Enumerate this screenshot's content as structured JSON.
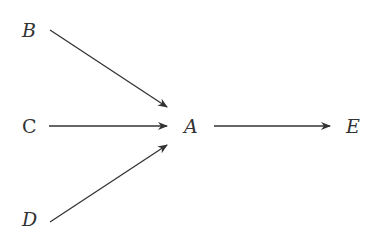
{
  "diagram": {
    "nodes": [
      {
        "id": "B",
        "label": "B",
        "italic": true
      },
      {
        "id": "C",
        "label": "C",
        "italic": false
      },
      {
        "id": "D",
        "label": "D",
        "italic": true
      },
      {
        "id": "A",
        "label": "A",
        "italic": true
      },
      {
        "id": "E",
        "label": "E",
        "italic": true
      }
    ],
    "edges": [
      {
        "from": "B",
        "to": "A"
      },
      {
        "from": "C",
        "to": "A"
      },
      {
        "from": "D",
        "to": "A"
      },
      {
        "from": "A",
        "to": "E"
      }
    ],
    "colors": {
      "line": "#333333",
      "text": "#333333",
      "background": "#ffffff"
    }
  }
}
